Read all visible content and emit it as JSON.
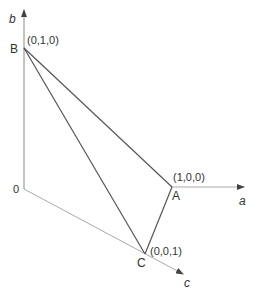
{
  "diagram": {
    "colors": {
      "triangle_edge": "#555555",
      "axis": "#999999",
      "text": "#333333"
    },
    "axes": {
      "a": {
        "label": "a"
      },
      "b": {
        "label": "b"
      },
      "c": {
        "label": "c"
      }
    },
    "origin": {
      "label": "0"
    },
    "vertices": {
      "A": {
        "label": "A",
        "coords": "(1,0,0)"
      },
      "B": {
        "label": "B",
        "coords": "(0,1,0)"
      },
      "C": {
        "label": "C",
        "coords": "(0,0,1)"
      }
    }
  }
}
